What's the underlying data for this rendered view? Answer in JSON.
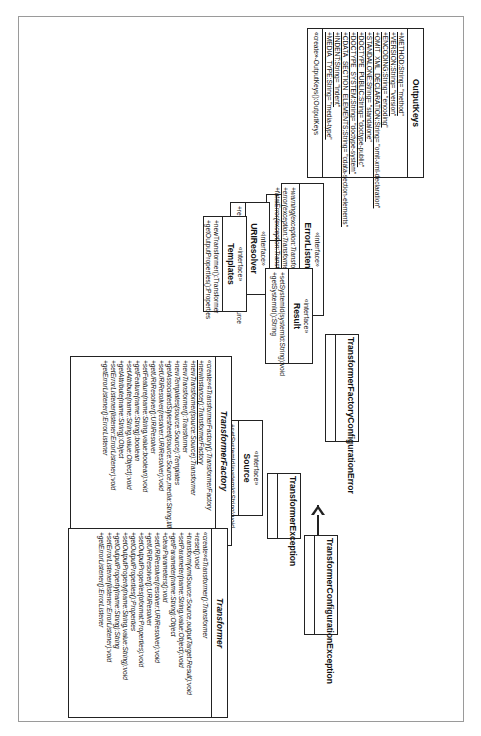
{
  "diagram": {
    "classes": {
      "outputkeys": {
        "name": "OutputKeys",
        "attributes": [
          "+METHOD:String= \"method\"",
          "+VERSION:String= \"version\"",
          "+ENCODING:String= \"encoding\"",
          "+OMIT_XML_DECLARATION:String= \"omit-xml-declaration\"",
          "+STANDALONE:String= \"standalone\"",
          "+DOCTYPE_PUBLIC:String= \"doctype-public\"",
          "+DOCTYPE_SYSTEM:String= \"doctype-system\"",
          "+CDATA_SECTION_ELEMENTS:String= \"cdata-section-elements\"",
          "+INDENT:String= \"indent\"",
          "+MEDIA_TYPE:String= \"media-type\""
        ],
        "operations": [
          "«create»-OutputKeys():OutputKeys"
        ]
      },
      "errorlistener": {
        "stereotype": "«interface»",
        "name": "ErrorListener",
        "operations": [
          "+warning(exception:TransformerException):void",
          "+error(exception:TransformerException):void",
          "+fatalError(exception:TransformerException):void"
        ]
      },
      "uriresolver": {
        "stereotype": "«interface»",
        "name": "URIResolver",
        "operations": [
          "+resolve(href:String,base:String):Source"
        ]
      },
      "templates": {
        "stereotype": "«interface»",
        "name": "Templates",
        "operations": [
          "+newTransformer():Transformer",
          "+getOutputProperties():Properties"
        ]
      },
      "result": {
        "stereotype": "«interface»",
        "name": "Result",
        "operations": [
          "+setSystemId(systemId:String):void",
          "+getSystemId():String"
        ]
      },
      "source": {
        "stereotype": "«interface»",
        "name": "Source",
        "operations": [
          "+setSystemId(systemId:String):void"
        ]
      },
      "transformerfactory": {
        "name": "TransformerFactory",
        "operations": [
          "«create»#TransformerFactory():TransformerFactory",
          "+newInstance():TransformerFactory",
          "+newTransformer(source:Source):Transformer",
          "+newTransformer():Transformer",
          "+newTemplates(source:Source):Templates",
          "+getAssociatedStylesheet(source:Source,media:String,title:String,charset:String):Source",
          "+setURIResolver(resolver:URIResolver):void",
          "+getURIResolver():URIResolver",
          "+setFeature(name:String,value:boolean):void",
          "+getFeature(name:String):boolean",
          "+setAttribute(name:String,value:Object):void",
          "+getAttribute(name:String):Object",
          "+setErrorListener(listener:ErrorListener):void",
          "+getErrorListener():ErrorListener"
        ]
      },
      "transformer": {
        "name": "Transformer",
        "operations": [
          "«create»#Transformer():Transformer",
          "+reset():void",
          "+transform(xmlSource:Source,outputTarget:Result):void",
          "+setParameter(name:String,value:Object):void",
          "+getParameter(name:String):Object",
          "+clearParameters():void",
          "+setURIResolver(resolver:URIResolver):void",
          "+getURIResolver():URIResolver",
          "+setOutputProperties(oformat:Properties):void",
          "+getOutputProperties():Properties",
          "+setOutputProperty(name:String,value:String):void",
          "+getOutputProperty(name:String):String",
          "+setErrorListener(listener:ErrorListener):void",
          "+getErrorListener():ErrorListener"
        ]
      },
      "transformerexception": {
        "name": "TransformerException"
      },
      "transformerconfigurationexception": {
        "name": "TransformerConfigurationException"
      },
      "transformerfactoryconfigurationerror": {
        "name": "TransformerFactoryConfigurationError"
      },
      "dom": {
        "name": "dom"
      },
      "stream": {
        "name": "stream"
      },
      "sax": {
        "name": "sax"
      }
    }
  }
}
